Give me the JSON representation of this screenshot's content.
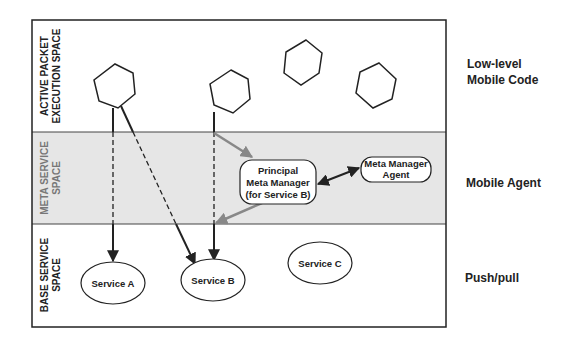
{
  "diagram": {
    "bands": [
      {
        "id": "active",
        "label_line1": "ACTIVE PACKET",
        "label_line2": "EXECUTION SPACE",
        "side_label_line1": "Low-level",
        "side_label_line2": "Mobile Code",
        "fill": "#ffffff"
      },
      {
        "id": "meta",
        "label_line1": "META SERVICE",
        "label_line2": "SPACE",
        "side_label_line1": "Mobile Agent",
        "fill": "#e6e6e6"
      },
      {
        "id": "base",
        "label_line1": "BASE SERVICE",
        "label_line2": "SPACE",
        "side_label_line1": "Push/pull",
        "fill": "#ffffff"
      }
    ],
    "nodes": {
      "service_a": "Service A",
      "service_b": "Service B",
      "service_c": "Service C",
      "principal_line1": "Principal",
      "principal_line2": "Meta Manager",
      "principal_line3": "(for Service B)",
      "agent_line1": "Meta Manager",
      "agent_line2": "Agent"
    },
    "hexagons": [
      {
        "id": "hex-1",
        "cx": 115,
        "cy": 87
      },
      {
        "id": "hex-2",
        "cx": 230,
        "cy": 93
      },
      {
        "id": "hex-3",
        "cx": 302,
        "cy": 62
      },
      {
        "id": "hex-4",
        "cx": 377,
        "cy": 85
      }
    ],
    "colors": {
      "stroke": "#222222",
      "meta_band": "#e6e6e6",
      "gray_arrow": "#888888"
    }
  }
}
